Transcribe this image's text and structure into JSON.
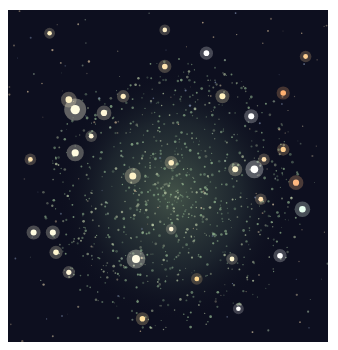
{
  "image": {
    "subject": "dwarf galaxy star field",
    "background_color": "#0d0f1f",
    "glow_color": "#6f8a6a",
    "stars": [
      {
        "x": 0.21,
        "y": 0.3,
        "b": 1.0,
        "c": "#fffbe0"
      },
      {
        "x": 0.19,
        "y": 0.27,
        "b": 0.6,
        "c": "#fff2c8"
      },
      {
        "x": 0.3,
        "y": 0.31,
        "b": 0.55,
        "c": "#fff6d8"
      },
      {
        "x": 0.21,
        "y": 0.43,
        "b": 0.7,
        "c": "#fffbe0"
      },
      {
        "x": 0.39,
        "y": 0.5,
        "b": 0.65,
        "c": "#fff3c8"
      },
      {
        "x": 0.51,
        "y": 0.46,
        "b": 0.45,
        "c": "#ffeec0"
      },
      {
        "x": 0.4,
        "y": 0.75,
        "b": 0.8,
        "c": "#fffbe6"
      },
      {
        "x": 0.77,
        "y": 0.48,
        "b": 0.75,
        "c": "#ffffff"
      },
      {
        "x": 0.71,
        "y": 0.48,
        "b": 0.5,
        "c": "#fff6d0"
      },
      {
        "x": 0.9,
        "y": 0.52,
        "b": 0.55,
        "c": "#ffb880"
      },
      {
        "x": 0.92,
        "y": 0.6,
        "b": 0.6,
        "c": "#e8fff0"
      },
      {
        "x": 0.86,
        "y": 0.25,
        "b": 0.45,
        "c": "#ffb070"
      },
      {
        "x": 0.67,
        "y": 0.26,
        "b": 0.5,
        "c": "#fff2c0"
      },
      {
        "x": 0.76,
        "y": 0.32,
        "b": 0.5,
        "c": "#ffffff"
      },
      {
        "x": 0.62,
        "y": 0.13,
        "b": 0.45,
        "c": "#ffffff"
      },
      {
        "x": 0.49,
        "y": 0.17,
        "b": 0.45,
        "c": "#ffe4b0"
      },
      {
        "x": 0.36,
        "y": 0.26,
        "b": 0.4,
        "c": "#ffeec0"
      },
      {
        "x": 0.26,
        "y": 0.38,
        "b": 0.35,
        "c": "#fff6d8"
      },
      {
        "x": 0.08,
        "y": 0.67,
        "b": 0.5,
        "c": "#fffbe0"
      },
      {
        "x": 0.14,
        "y": 0.67,
        "b": 0.5,
        "c": "#fffbe0"
      },
      {
        "x": 0.15,
        "y": 0.73,
        "b": 0.45,
        "c": "#fff6d0"
      },
      {
        "x": 0.19,
        "y": 0.79,
        "b": 0.4,
        "c": "#fff6d8"
      },
      {
        "x": 0.42,
        "y": 0.93,
        "b": 0.45,
        "c": "#ffe0a0"
      },
      {
        "x": 0.85,
        "y": 0.74,
        "b": 0.45,
        "c": "#ffffff"
      },
      {
        "x": 0.7,
        "y": 0.75,
        "b": 0.35,
        "c": "#fff6d0"
      },
      {
        "x": 0.86,
        "y": 0.42,
        "b": 0.4,
        "c": "#ffd090"
      },
      {
        "x": 0.8,
        "y": 0.45,
        "b": 0.35,
        "c": "#ffe0b0"
      },
      {
        "x": 0.93,
        "y": 0.14,
        "b": 0.35,
        "c": "#ffd090"
      },
      {
        "x": 0.07,
        "y": 0.45,
        "b": 0.35,
        "c": "#ffe4b0"
      },
      {
        "x": 0.13,
        "y": 0.07,
        "b": 0.3,
        "c": "#fff0c0"
      },
      {
        "x": 0.59,
        "y": 0.81,
        "b": 0.35,
        "c": "#ffd890"
      },
      {
        "x": 0.79,
        "y": 0.57,
        "b": 0.35,
        "c": "#ffe0b0"
      },
      {
        "x": 0.51,
        "y": 0.66,
        "b": 0.3,
        "c": "#fff6d8"
      },
      {
        "x": 0.72,
        "y": 0.9,
        "b": 0.3,
        "c": "#ffffff"
      },
      {
        "x": 0.49,
        "y": 0.06,
        "b": 0.3,
        "c": "#fff0c8"
      }
    ]
  }
}
